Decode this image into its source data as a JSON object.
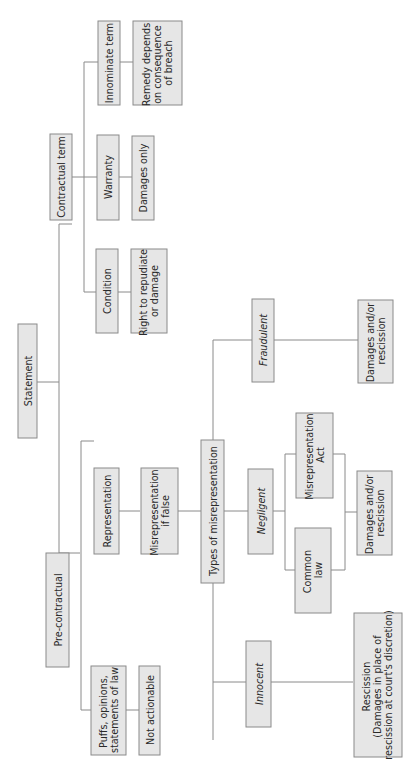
{
  "diagram": {
    "orientation": "rotated-90-ccw",
    "colors": {
      "box_fill": "#e6e6e6",
      "box_stroke": "#8a8a8a",
      "line": "#8a8a8a",
      "text": "#2a2a2a"
    },
    "nodes": {
      "statement": {
        "lines": [
          "Statement"
        ]
      },
      "contractual_term": {
        "lines": [
          "Contractual term"
        ]
      },
      "pre_contractual": {
        "lines": [
          "Pre-contractual"
        ]
      },
      "condition": {
        "lines": [
          "Condition"
        ]
      },
      "condition_remedy": {
        "lines": [
          "Right to repudiate",
          "or damage"
        ]
      },
      "warranty": {
        "lines": [
          "Warranty"
        ]
      },
      "warranty_remedy": {
        "lines": [
          "Damages only"
        ]
      },
      "innominate_term": {
        "lines": [
          "Innominate term"
        ]
      },
      "innominate_remedy": {
        "lines": [
          "Remedy depends",
          "on consequence",
          "of breach"
        ]
      },
      "representation": {
        "lines": [
          "Representation"
        ]
      },
      "misrep_if_false": {
        "lines": [
          "Misrepresentation",
          "if false"
        ]
      },
      "types_of_misrep": {
        "lines": [
          "Types of misrepresentation"
        ]
      },
      "puffs": {
        "lines": [
          "Puffs, opinions,",
          "statements of law"
        ]
      },
      "not_actionable": {
        "lines": [
          "Not actionable"
        ]
      },
      "innocent": {
        "lines": [
          "Innocent"
        ],
        "italic": true
      },
      "innocent_remedy": {
        "lines": [
          "Rescission",
          "(Damages in place of",
          "rescission at court's discretion)"
        ]
      },
      "negligent": {
        "lines": [
          "Negligent"
        ],
        "italic": true
      },
      "common_law": {
        "lines": [
          "Common",
          "law"
        ]
      },
      "misrep_act": {
        "lines": [
          "Misrepresentation",
          "Act"
        ]
      },
      "negligent_remedy": {
        "lines": [
          "Damages and/or",
          "rescission"
        ]
      },
      "fraudulent": {
        "lines": [
          "Fraudulent"
        ],
        "italic": true
      },
      "fraudulent_remedy": {
        "lines": [
          "Damages and/or",
          "rescission"
        ]
      }
    },
    "edges": [
      [
        "statement",
        "contractual_term"
      ],
      [
        "statement",
        "pre_contractual"
      ],
      [
        "contractual_term",
        "condition"
      ],
      [
        "contractual_term",
        "warranty"
      ],
      [
        "contractual_term",
        "innominate_term"
      ],
      [
        "condition",
        "condition_remedy"
      ],
      [
        "warranty",
        "warranty_remedy"
      ],
      [
        "innominate_term",
        "innominate_remedy"
      ],
      [
        "pre_contractual",
        "representation"
      ],
      [
        "pre_contractual",
        "puffs"
      ],
      [
        "puffs",
        "not_actionable"
      ],
      [
        "representation",
        "misrep_if_false"
      ],
      [
        "misrep_if_false",
        "types_of_misrep"
      ],
      [
        "types_of_misrep",
        "innocent"
      ],
      [
        "types_of_misrep",
        "negligent"
      ],
      [
        "types_of_misrep",
        "fraudulent"
      ],
      [
        "innocent",
        "innocent_remedy"
      ],
      [
        "negligent",
        "common_law"
      ],
      [
        "negligent",
        "misrep_act"
      ],
      [
        "common_law",
        "negligent_remedy"
      ],
      [
        "misrep_act",
        "negligent_remedy"
      ],
      [
        "fraudulent",
        "fraudulent_remedy"
      ]
    ]
  }
}
